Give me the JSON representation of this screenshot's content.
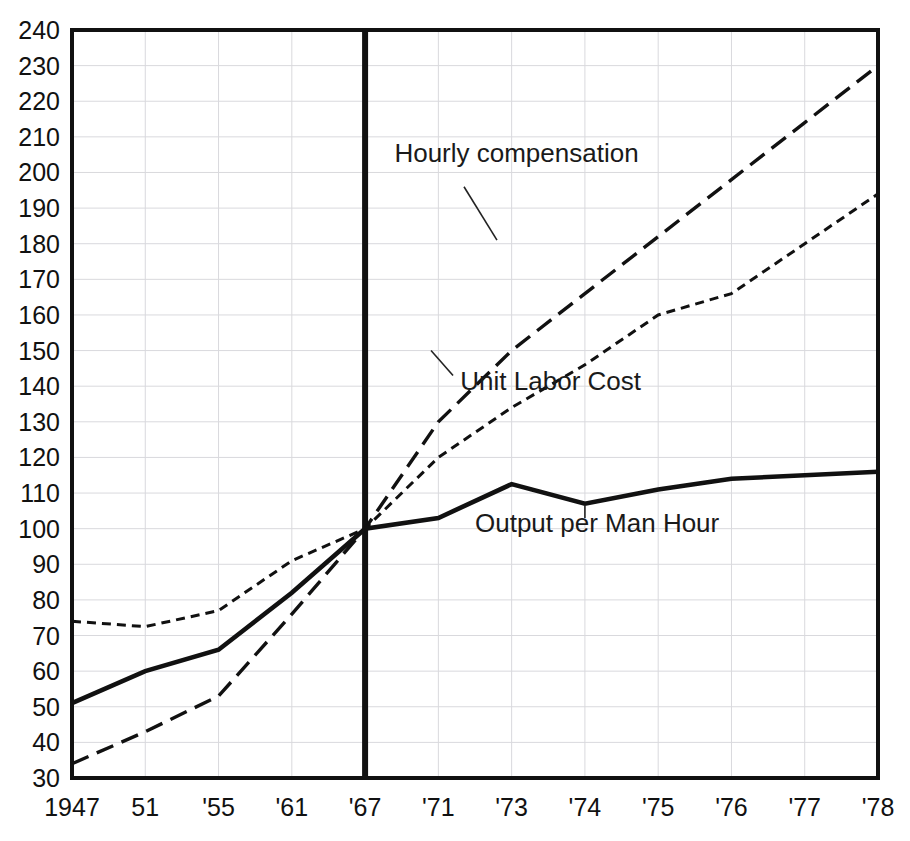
{
  "chart_data": {
    "type": "line",
    "title": "",
    "subtitle": "",
    "xlabel": "",
    "ylabel": "",
    "index_base": "1967 = 100",
    "grid": true,
    "legend_position": "inline-annotations",
    "x": [
      1947,
      1951,
      1955,
      1961,
      1967,
      1971,
      1973,
      1974,
      1975,
      1976,
      1977,
      1978
    ],
    "categories": [
      "1947",
      "51",
      "'55",
      "'61",
      "'67",
      "'71",
      "'73",
      "'74",
      "'75",
      "'76",
      "'77",
      "'78"
    ],
    "xtick_labels": [
      "1947",
      "51",
      "'55",
      "'61",
      "'67",
      "'71",
      "'73",
      "'74",
      "'75",
      "'76",
      "'77",
      "'78"
    ],
    "ytick_labels": [
      "240",
      "230",
      "220",
      "210",
      "200",
      "190",
      "180",
      "170",
      "160",
      "150",
      "140",
      "130",
      "120",
      "110",
      "100",
      "90",
      "80",
      "70",
      "60",
      "50",
      "40",
      "30"
    ],
    "ytick_values": [
      240,
      230,
      220,
      210,
      200,
      190,
      180,
      170,
      160,
      150,
      140,
      130,
      120,
      110,
      100,
      90,
      80,
      70,
      60,
      50,
      40,
      30
    ],
    "ylim": [
      30,
      240
    ],
    "ytick_step": 10,
    "xlim": [
      1947,
      1978
    ],
    "baseline_year": 1967,
    "baseline_value": 100,
    "series": [
      {
        "name": "Hourly compensation",
        "label": "Hourly compensation",
        "style": "long-dash",
        "dasharray": "18 9",
        "stroke_width": 3.4,
        "color": "#111111",
        "values": [
          34,
          43,
          53,
          76,
          100,
          130,
          150,
          166,
          182,
          198,
          214,
          230
        ],
        "label_x": 1968.6,
        "label_y": 203,
        "leader_from_x": 1971.7,
        "leader_from_y": 196,
        "leader_to_x": 1972.6,
        "leader_to_y": 181
      },
      {
        "name": "Unit Labor Cost",
        "label": "Unit Labor Cost",
        "style": "short-dash",
        "dasharray": "9 6",
        "stroke_width": 3.0,
        "color": "#111111",
        "values": [
          74,
          72.5,
          77,
          91,
          100,
          120,
          134,
          146,
          160,
          166,
          180,
          194
        ],
        "label_x": 1971.6,
        "label_y": 139,
        "leader_from_x": 1971.4,
        "leader_from_y": 143,
        "leader_to_x": 1970.6,
        "leader_to_y": 150
      },
      {
        "name": "Output per Man Hour",
        "label": "Output per Man Hour",
        "style": "solid",
        "dasharray": "",
        "stroke_width": 4.6,
        "color": "#111111",
        "values": [
          51,
          60,
          66,
          82,
          100,
          103,
          112.5,
          107,
          111,
          114,
          115,
          116
        ],
        "label_x": 1972.0,
        "label_y": 99,
        "leader_from_x": 1974.0,
        "leader_from_y": 103,
        "leader_to_x": 1974.0,
        "leader_to_y": 106.5
      }
    ],
    "annotations": [
      {
        "text": "Hourly compensation",
        "series": "Hourly compensation"
      },
      {
        "text": "Unit Labor Cost",
        "series": "Unit Labor Cost"
      },
      {
        "text": "Output per Man Hour",
        "series": "Output per Man Hour"
      }
    ],
    "colors": {
      "ink": "#111111",
      "grid": "#d9d9dd",
      "background": "#ffffff"
    }
  }
}
